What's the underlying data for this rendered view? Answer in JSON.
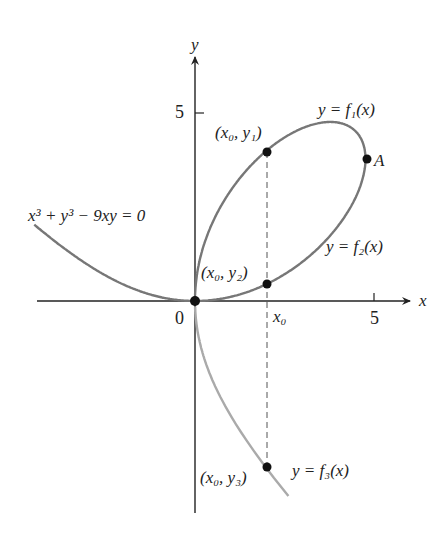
{
  "figure": {
    "equation": "x³ + y³ − 9xy = 0",
    "axes": {
      "x_label": "x",
      "y_label": "y",
      "origin_label": "0",
      "x_tick_label": "5",
      "y_tick_label": "5",
      "x0_label": "x₀"
    },
    "curves": [
      {
        "name": "f1",
        "label": "y = f₁(x)",
        "color": "#777777"
      },
      {
        "name": "f2",
        "label": "y = f₂(x)",
        "color": "#777777"
      },
      {
        "name": "f3",
        "label": "y = f₃(x)",
        "color": "#aaaaaa"
      }
    ],
    "points": [
      {
        "label": "(x₀, y₁)"
      },
      {
        "label": "(x₀, y₂)"
      },
      {
        "label": "(x₀, y₃)"
      },
      {
        "label": "A"
      }
    ]
  }
}
